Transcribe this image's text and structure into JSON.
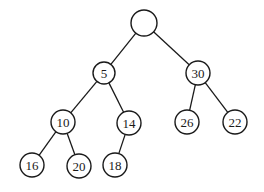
{
  "diagram": {
    "type": "binary-tree",
    "nodes": [
      {
        "id": "root",
        "label": "",
        "x": 144,
        "y": 23,
        "r": 13
      },
      {
        "id": "n5",
        "label": "5",
        "x": 104,
        "y": 73,
        "r": 11
      },
      {
        "id": "n30",
        "label": "30",
        "x": 198,
        "y": 73,
        "r": 12
      },
      {
        "id": "n10",
        "label": "10",
        "x": 63,
        "y": 122,
        "r": 12
      },
      {
        "id": "n14",
        "label": "14",
        "x": 129,
        "y": 123,
        "r": 12
      },
      {
        "id": "n26",
        "label": "26",
        "x": 187,
        "y": 122,
        "r": 12
      },
      {
        "id": "n22",
        "label": "22",
        "x": 235,
        "y": 122,
        "r": 12
      },
      {
        "id": "n16",
        "label": "16",
        "x": 32,
        "y": 165,
        "r": 12
      },
      {
        "id": "n20",
        "label": "20",
        "x": 79,
        "y": 166,
        "r": 12
      },
      {
        "id": "n18",
        "label": "18",
        "x": 115,
        "y": 165,
        "r": 12
      }
    ],
    "edges": [
      [
        "root",
        "n5"
      ],
      [
        "root",
        "n30"
      ],
      [
        "n5",
        "n10"
      ],
      [
        "n5",
        "n14"
      ],
      [
        "n30",
        "n26"
      ],
      [
        "n30",
        "n22"
      ],
      [
        "n10",
        "n16"
      ],
      [
        "n10",
        "n20"
      ],
      [
        "n14",
        "n18"
      ]
    ]
  }
}
